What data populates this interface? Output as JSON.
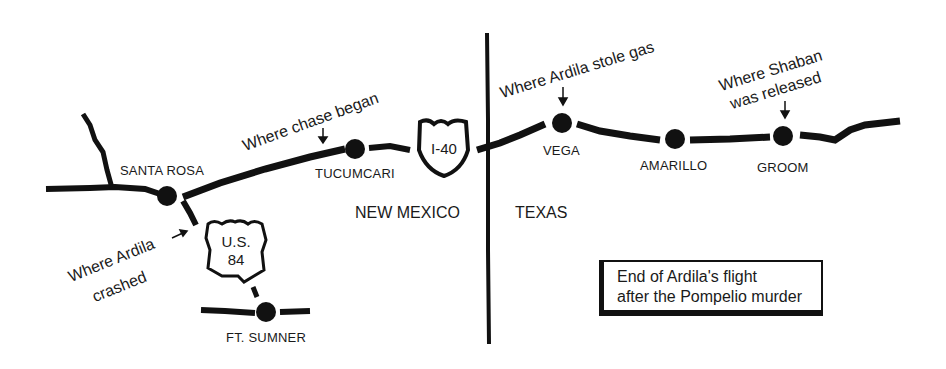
{
  "map": {
    "cities": [
      {
        "name": "SANTA ROSA"
      },
      {
        "name": "TUCUMCARI"
      },
      {
        "name": "VEGA"
      },
      {
        "name": "AMARILLO"
      },
      {
        "name": "GROOM"
      },
      {
        "name": "FT. SUMNER"
      }
    ],
    "states": {
      "west": "NEW MEXICO",
      "east": "TEXAS"
    },
    "shields": {
      "interstate": "I-40",
      "us_route_line1": "U.S.",
      "us_route_line2": "84"
    },
    "annotations": {
      "chase_began": "Where chase began",
      "stole_gas": "Where Ardila stole gas",
      "shaban_line1": "Where Shaban",
      "shaban_line2": "was released",
      "crashed_line1": "Where Ardila",
      "crashed_line2": "crashed"
    },
    "legend": {
      "line1": "End of Ardila's flight",
      "line2": "after the Pompelio murder"
    },
    "colors": {
      "ink": "#111111",
      "paper": "#ffffff"
    }
  }
}
